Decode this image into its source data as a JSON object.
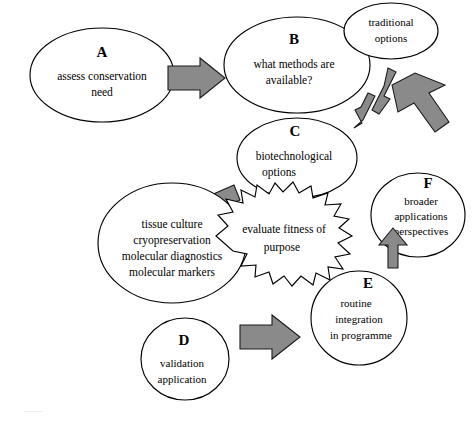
{
  "diagram": {
    "type": "flow-diagram",
    "nodes": [
      {
        "id": "A",
        "letter": "A",
        "lines": [
          "assess conservation",
          "need"
        ],
        "shape": "ellipse"
      },
      {
        "id": "B",
        "letter": "B",
        "lines": [
          "what methods are",
          "available?"
        ],
        "shape": "ellipse"
      },
      {
        "id": "traditional",
        "letter": "",
        "lines": [
          "traditional",
          "options"
        ],
        "shape": "ellipse"
      },
      {
        "id": "C",
        "letter": "C",
        "lines": [
          "biotechnological",
          "options"
        ],
        "shape": "ellipse"
      },
      {
        "id": "methods",
        "letter": "",
        "lines": [
          "tissue culture",
          "cryopreservation",
          "molecular diagnostics",
          "molecular markers"
        ],
        "shape": "ellipse"
      },
      {
        "id": "evaluate",
        "letter": "",
        "lines": [
          "evaluate fitness of",
          "purpose"
        ],
        "shape": "starburst"
      },
      {
        "id": "F",
        "letter": "F",
        "lines": [
          "broader",
          "applications",
          "perspectives"
        ],
        "shape": "ellipse"
      },
      {
        "id": "E",
        "letter": "E",
        "lines": [
          "routine",
          "integration",
          "in programme"
        ],
        "shape": "ellipse"
      },
      {
        "id": "D",
        "letter": "D",
        "lines": [
          "validation",
          "application"
        ],
        "shape": "ellipse"
      }
    ],
    "arrows": [
      {
        "id": "a-to-b",
        "from": "A",
        "to": "B",
        "style": "block",
        "direction": "right"
      },
      {
        "id": "c-to-methods",
        "from": "C",
        "to": "methods",
        "style": "block",
        "direction": "down-left"
      },
      {
        "id": "traditional-c-up",
        "from": "C",
        "to": "traditional",
        "style": "thin",
        "direction": "up"
      },
      {
        "id": "traditional-c-down",
        "from": "traditional",
        "to": "C",
        "style": "thin",
        "direction": "down"
      },
      {
        "id": "f-to-traditional",
        "from": "F",
        "to": "traditional",
        "style": "block",
        "direction": "up-left"
      },
      {
        "id": "e-to-f",
        "from": "E",
        "to": "F",
        "style": "block",
        "direction": "up"
      },
      {
        "id": "d-to-e",
        "from": "D",
        "to": "E",
        "style": "block",
        "direction": "right"
      }
    ]
  },
  "colors": {
    "arrow_fill": "#8a8a8a",
    "outline": "#000000",
    "background": "#ffffff"
  },
  "caption": {
    "text": "......."
  }
}
